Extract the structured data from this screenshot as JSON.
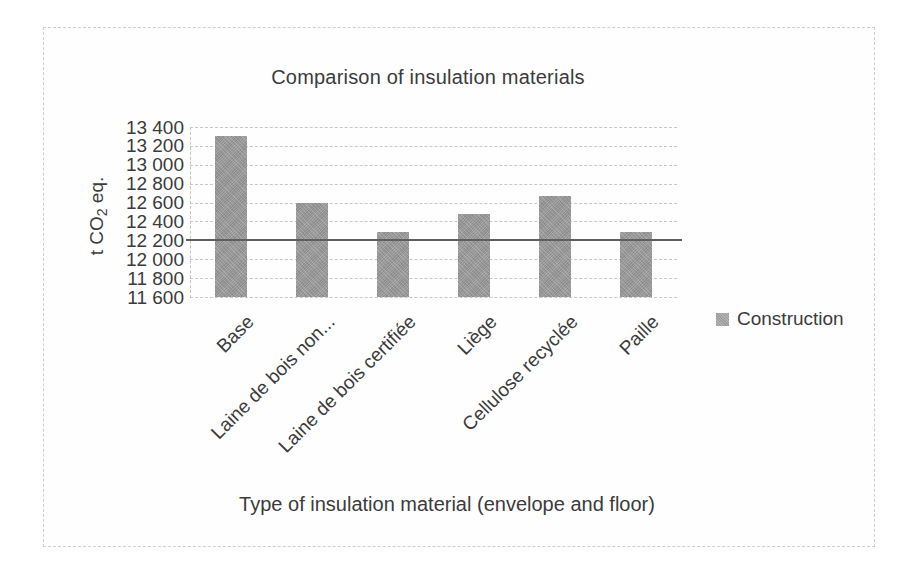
{
  "figure": {
    "border_color": "#cfcfcf",
    "background": "#ffffff"
  },
  "chart_data": {
    "type": "bar",
    "title": "Comparison of insulation materials",
    "xlabel": "Type of insulation material (envelope and floor)",
    "ylabel": "t CO2 eq.",
    "ylabel_parts": {
      "prefix": "t CO",
      "sub": "2",
      "suffix": " eq."
    },
    "categories": [
      "Base",
      "Laine de bois non...",
      "Laine de bois certifiée",
      "Liège",
      "Cellulose recyclée",
      "Paille"
    ],
    "series": [
      {
        "name": "Construction",
        "values": [
          13300,
          12600,
          12290,
          12480,
          12670,
          12290
        ]
      }
    ],
    "ylim": [
      11600,
      13400
    ],
    "ytick_step": 200,
    "ytick_labels": [
      "13 400",
      "13 200",
      "13 000",
      "12 800",
      "12 600",
      "12 400",
      "12 200",
      "12 000",
      "11 800",
      "11 600"
    ],
    "reference_line": {
      "value": 12200,
      "color": "#5f5f5f"
    },
    "grid": true,
    "legend_position": "right",
    "bar_color": "#9d9d9d"
  }
}
